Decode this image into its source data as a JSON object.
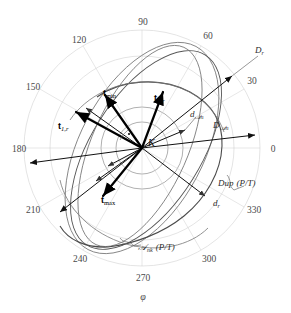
{
  "figure": {
    "type": "polar-vector-diagram",
    "axis_variable": "φ",
    "center_label": "K",
    "angular_ticks": [
      {
        "value": "0",
        "angle_deg": 0
      },
      {
        "value": "30",
        "angle_deg": 30
      },
      {
        "value": "60",
        "angle_deg": 60
      },
      {
        "value": "90",
        "angle_deg": 90
      },
      {
        "value": "120",
        "angle_deg": 120
      },
      {
        "value": "150",
        "angle_deg": 150
      },
      {
        "value": "180",
        "angle_deg": 180
      },
      {
        "value": "210",
        "angle_deg": 210
      },
      {
        "value": "240",
        "angle_deg": 240
      },
      {
        "value": "270",
        "angle_deg": 270
      },
      {
        "value": "300",
        "angle_deg": 300
      },
      {
        "value": "330",
        "angle_deg": 330
      }
    ],
    "vectors": [
      {
        "id": "t-min",
        "base": "t",
        "sub": "min",
        "sub_italic": false
      },
      {
        "id": "t-1r",
        "base": "t",
        "sub": "1,r",
        "sub_italic": true
      },
      {
        "id": "t-2r",
        "base": "t",
        "sub": "2,r",
        "sub_italic": true
      },
      {
        "id": "t-max",
        "base": "t",
        "sub": "max",
        "sub_italic": false
      }
    ],
    "annotations": [
      {
        "id": "D-r",
        "base": "D",
        "sub": "r",
        "suffix": ""
      },
      {
        "id": "D-Aen",
        "base": "D",
        "sub": "𝒜ₙ",
        "suffix": ""
      },
      {
        "id": "d-Aen",
        "base": "d",
        "sub": "𝒜ₙ",
        "suffix": ""
      },
      {
        "id": "d-r",
        "base": "d",
        "sub": "r",
        "suffix": ""
      },
      {
        "id": "Dup-PT",
        "base": "Dup",
        "sub": "",
        "suffix": "(P/T)"
      },
      {
        "id": "Aenk-PT",
        "base": "𝒜",
        "sub": "ₙₖ",
        "suffix": "(P/T)"
      }
    ],
    "labels": {
      "D_r": "D",
      "D_r_sub": "r",
      "D_Aen": "D",
      "D_Aen_sub": "𝒜n",
      "d_Aen": "d",
      "d_Aen_sub": "𝒜n",
      "d_r": "d",
      "d_r_sub": "r",
      "Dup": "Dup",
      "Dup_suffix": "(P/T)",
      "Aenk": "𝒜",
      "Aenk_sub": "nk",
      "Aenk_suffix": "(P/T)",
      "t": "t",
      "t_min_sub": "min",
      "t_max_sub": "max",
      "t_1r_sub": "1,r",
      "t_2r_sub": "2,r",
      "phi": "φ",
      "K": "K"
    },
    "colors": {
      "background": "#ffffff",
      "grid": "#cfcfcf",
      "ellipse": "#777777",
      "curve": "#4b4b4b",
      "vector": "#000000",
      "tick_text": "#4a4a4a"
    }
  }
}
